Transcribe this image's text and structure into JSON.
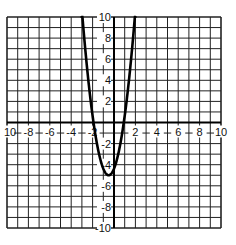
{
  "chart_data": {
    "type": "line",
    "title": "",
    "xlabel": "",
    "ylabel": "",
    "xlim": [
      -10,
      10
    ],
    "ylim": [
      -10,
      10
    ],
    "grid": true,
    "grid_step": 1,
    "x_tick_labels": [
      "10",
      "-8",
      "-6",
      "-4",
      "-2",
      "2",
      "4",
      "6",
      "8",
      "10"
    ],
    "x_tick_values": [
      -10,
      -8,
      -6,
      -4,
      -2,
      2,
      4,
      6,
      8,
      10
    ],
    "y_tick_labels": [
      "10",
      "8",
      "6",
      "4",
      "2",
      "-2",
      "-4",
      "-6",
      "-8",
      "-10"
    ],
    "y_tick_values": [
      10,
      8,
      6,
      4,
      2,
      -2,
      -4,
      -6,
      -8,
      -10
    ],
    "series": [
      {
        "name": "parabola",
        "equation_estimate": "y = 2.5(x + 0.5)^2 - 5",
        "vertex": [
          -0.5,
          -5
        ],
        "x_intercepts": [
          -1.9,
          0.9
        ],
        "x": [
          -3.0,
          -2.5,
          -2.0,
          -1.5,
          -1.0,
          -0.5,
          0.0,
          0.5,
          1.0,
          1.5,
          2.0
        ],
        "y": [
          10.6,
          5.0,
          0.6,
          -2.5,
          -4.4,
          -5.0,
          -4.4,
          -2.5,
          0.6,
          5.0,
          10.6
        ]
      }
    ],
    "legend": null
  }
}
